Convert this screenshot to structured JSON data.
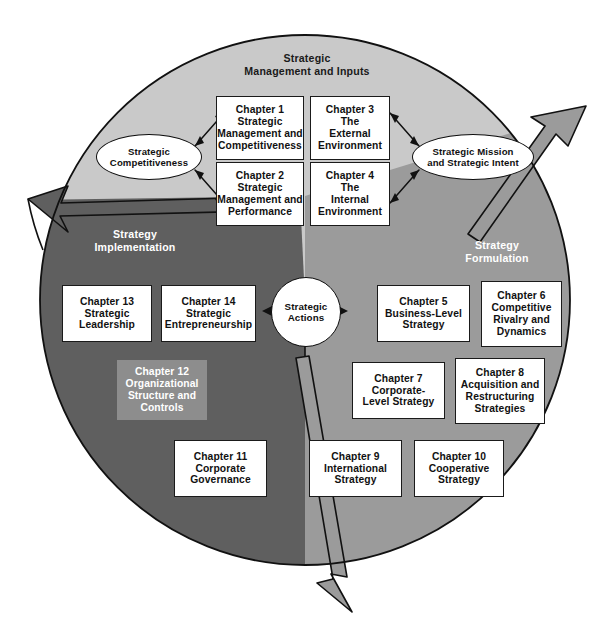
{
  "figure": {
    "palette": {
      "top_segment": "#c9c9c9",
      "left_segment": "#5f5f5f",
      "right_segment": "#9b9b9b",
      "box_fill": "#ffffff",
      "box_border": "#1a1a1a",
      "shaded_box_fill": "#8d8d8d",
      "text_dark": "#111111",
      "text_light": "#ffffff",
      "background": "#ffffff"
    }
  },
  "segments": [
    {
      "id": "strategic-management-and-inputs",
      "label_lines": [
        "Strategic",
        "Management and Inputs"
      ],
      "tone": "light"
    },
    {
      "id": "strategy-implementation",
      "label_lines": [
        "Strategy",
        "Implementation"
      ],
      "tone": "dark"
    },
    {
      "id": "strategy-formulation",
      "label_lines": [
        "Strategy",
        "Formulation"
      ],
      "tone": "dark"
    }
  ],
  "nodes": {
    "center": {
      "id": "strategic-actions",
      "lines": [
        "Strategic",
        "Actions"
      ]
    },
    "ellipse_left": {
      "id": "strategic-competitiveness",
      "lines": [
        "Strategic",
        "Competitiveness"
      ]
    },
    "ellipse_right": {
      "id": "strategic-mission-and-strategic-intent",
      "lines": [
        "Strategic Mission",
        "and Strategic Intent"
      ]
    }
  },
  "chapters": [
    {
      "id": "chapter-1",
      "number": "Chapter 1",
      "lines": [
        "Chapter 1",
        "Strategic",
        "Management and",
        "Competitiveness"
      ],
      "shaded": false,
      "section": "strategic-management-and-inputs"
    },
    {
      "id": "chapter-2",
      "number": "Chapter 2",
      "lines": [
        "Chapter 2",
        "Strategic",
        "Management and",
        "Performance"
      ],
      "shaded": false,
      "section": "strategic-management-and-inputs"
    },
    {
      "id": "chapter-3",
      "number": "Chapter 3",
      "lines": [
        "Chapter 3",
        "The",
        "External",
        "Environment"
      ],
      "shaded": false,
      "section": "strategic-management-and-inputs"
    },
    {
      "id": "chapter-4",
      "number": "Chapter 4",
      "lines": [
        "Chapter 4",
        "The",
        "Internal",
        "Environment"
      ],
      "shaded": false,
      "section": "strategic-management-and-inputs"
    },
    {
      "id": "chapter-5",
      "number": "Chapter 5",
      "lines": [
        "Chapter 5",
        "Business-Level",
        "Strategy"
      ],
      "shaded": false,
      "section": "strategy-formulation"
    },
    {
      "id": "chapter-6",
      "number": "Chapter 6",
      "lines": [
        "Chapter 6",
        "Competitive",
        "Rivalry and",
        "Dynamics"
      ],
      "shaded": false,
      "section": "strategy-formulation"
    },
    {
      "id": "chapter-7",
      "number": "Chapter 7",
      "lines": [
        "Chapter 7",
        "Corporate-",
        "Level Strategy"
      ],
      "shaded": false,
      "section": "strategy-formulation"
    },
    {
      "id": "chapter-8",
      "number": "Chapter 8",
      "lines": [
        "Chapter 8",
        "Acquisition and",
        "Restructuring",
        "Strategies"
      ],
      "shaded": false,
      "section": "strategy-formulation"
    },
    {
      "id": "chapter-9",
      "number": "Chapter 9",
      "lines": [
        "Chapter 9",
        "International",
        "Strategy"
      ],
      "shaded": false,
      "section": "strategy-formulation"
    },
    {
      "id": "chapter-10",
      "number": "Chapter 10",
      "lines": [
        "Chapter 10",
        "Cooperative",
        "Strategy"
      ],
      "shaded": false,
      "section": "strategy-formulation"
    },
    {
      "id": "chapter-11",
      "number": "Chapter 11",
      "lines": [
        "Chapter 11",
        "Corporate",
        "Governance"
      ],
      "shaded": false,
      "section": "strategy-implementation"
    },
    {
      "id": "chapter-12",
      "number": "Chapter 12",
      "lines": [
        "Chapter 12",
        "Organizational",
        "Structure and",
        "Controls"
      ],
      "shaded": true,
      "section": "strategy-implementation"
    },
    {
      "id": "chapter-13",
      "number": "Chapter 13",
      "lines": [
        "Chapter 13",
        "Strategic",
        "Leadership"
      ],
      "shaded": false,
      "section": "strategy-implementation"
    },
    {
      "id": "chapter-14",
      "number": "Chapter 14",
      "lines": [
        "Chapter 14",
        "Strategic",
        "Entrepreneurship"
      ],
      "shaded": false,
      "section": "strategy-implementation"
    }
  ],
  "connectors": [
    {
      "id": "competitiveness-to-chapter-1",
      "kind": "double-arrow"
    },
    {
      "id": "competitiveness-to-chapter-2",
      "kind": "double-arrow"
    },
    {
      "id": "chapter-3-to-mission",
      "kind": "double-arrow"
    },
    {
      "id": "chapter-4-to-mission",
      "kind": "double-arrow"
    },
    {
      "id": "strategic-actions-arrow-left",
      "kind": "single-arrow"
    },
    {
      "id": "strategic-actions-arrow-right",
      "kind": "single-arrow"
    },
    {
      "id": "cycle-arrow-left",
      "kind": "segment-arrowhead"
    },
    {
      "id": "cycle-arrow-upper-right",
      "kind": "segment-arrowhead"
    },
    {
      "id": "cycle-arrow-bottom",
      "kind": "segment-arrowhead"
    }
  ]
}
